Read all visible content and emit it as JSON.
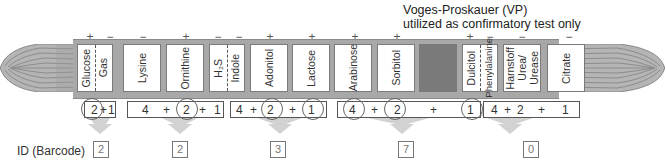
{
  "note": {
    "line1": "Voges-Proskauer (VP)",
    "line2": "utilized as confirmatory test only"
  },
  "tests": [
    {
      "name": "Glucose",
      "result": "+"
    },
    {
      "name": "Gas",
      "result": "−"
    },
    {
      "name": "Lysine",
      "result": "−"
    },
    {
      "name": "Ornithine",
      "result": "+"
    },
    {
      "name": "H2S",
      "result": "−"
    },
    {
      "name": "Indole",
      "result": "−"
    },
    {
      "name": "Adonitol",
      "result": "+"
    },
    {
      "name": "Lactose",
      "result": "+"
    },
    {
      "name": "Arabinose",
      "result": "+"
    },
    {
      "name": "Sorbitol",
      "result": "+"
    },
    {
      "name": "VP (blank)",
      "result": ""
    },
    {
      "name": "Dulcitol",
      "result": "+"
    },
    {
      "name": "Phenylalanine",
      "result": "−"
    },
    {
      "name": "Harnstoff Urea/ Urease",
      "result": "−"
    },
    {
      "name": "Citrate",
      "result": "−"
    }
  ],
  "labels": {
    "glucose": "Glucose",
    "gas": "Gas",
    "lysine": "Lysine",
    "ornithine": "Ornithine",
    "h2s": "H₂S",
    "indole": "Indole",
    "adonitol": "Adonitol",
    "lactose": "Lactose",
    "arabinose": "Arabinose",
    "sorbitol": "Sorbitol",
    "dulcitol": "Dulcitol",
    "phenylalanine": "Phenylalanine",
    "urease_1": "Harnstoff",
    "urease_2": "Urea/",
    "urease_3": "Urease",
    "citrate": "Citrate"
  },
  "signs": {
    "glucose": "+",
    "gas": "−",
    "lysine": "−",
    "ornithine": "+",
    "h2s": "−",
    "indole": "−",
    "adonitol": "+",
    "lactose": "+",
    "arabinose": "+",
    "sorbitol": "+",
    "dulcitol": "+",
    "phenylalanine": "−",
    "urease": "−",
    "citrate": "−"
  },
  "groups": [
    {
      "weights": [
        "2",
        "+",
        "1"
      ],
      "circled": [
        "2"
      ],
      "id": "2"
    },
    {
      "weights": [
        "4",
        "+",
        "2",
        "+",
        "1"
      ],
      "circled": [
        "2"
      ],
      "id": "2"
    },
    {
      "weights": [
        "4",
        "+",
        "2",
        "+",
        "1"
      ],
      "circled": [
        "2",
        "1"
      ],
      "id": "3"
    },
    {
      "weights": [
        "4",
        "+",
        "2",
        "+",
        "1"
      ],
      "circled": [
        "4",
        "2",
        "1"
      ],
      "id": "7"
    },
    {
      "weights": [
        "4",
        "+",
        "2",
        "+",
        "1"
      ],
      "circled": [],
      "id": "0"
    }
  ],
  "id_label": "ID (Barcode)",
  "colors": {
    "tube": "#a8a8a8",
    "well": "#ffffff",
    "vp_well": "#7a7a7a",
    "arrow": "#cfcfcf"
  }
}
